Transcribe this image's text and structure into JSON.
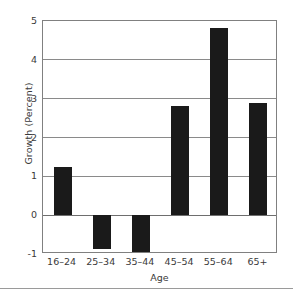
{
  "chart_data": {
    "type": "bar",
    "title": "",
    "xlabel": "Age",
    "ylabel": "Growth (Percent)",
    "categories": [
      "16–24",
      "25–34",
      "35–44",
      "45–54",
      "55–64",
      "65+"
    ],
    "values": [
      1.25,
      -0.88,
      -0.95,
      2.82,
      4.83,
      2.9
    ],
    "ylim": [
      -1,
      5
    ],
    "yticks": [
      5,
      4,
      3,
      2,
      1,
      0,
      -1
    ],
    "ytick_labels": [
      "5",
      "4",
      "3",
      "2",
      "1",
      "0",
      "-1"
    ],
    "grid": true,
    "grid_axis": "y",
    "legend": false,
    "bar_color": "#1a1a1a",
    "grid_color": "#8a8a8a",
    "frame_color": "#808080",
    "background_color": "#ffffff",
    "text_color": "#3a3a3a"
  }
}
